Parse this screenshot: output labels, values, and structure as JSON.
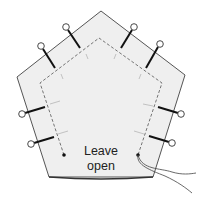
{
  "diagram": {
    "label": {
      "line1": "Leave",
      "line2": "open"
    },
    "colors": {
      "fabric_fill": "#efefef",
      "outline": "#555555",
      "stitch": "#666666",
      "pin_shaft": "#111111",
      "pin_head_fill": "#ffffff",
      "thread": "#444444"
    },
    "shapes": {
      "outer_pentagon": "101,11 185,75 153,177 49,177 17,77",
      "stitch_line": "64,155 40,83 99,38 162,83 138,155",
      "start_dot": [
        64,
        155
      ],
      "end_dot": [
        138,
        155
      ]
    },
    "pins": [
      {
        "name": "pin-top-left-1",
        "x1": 55,
        "y1": 68,
        "x2": 41,
        "y2": 46
      },
      {
        "name": "pin-top-left-2",
        "x1": 80,
        "y1": 48,
        "x2": 66,
        "y2": 27
      },
      {
        "name": "pin-top-right-1",
        "x1": 121,
        "y1": 48,
        "x2": 134,
        "y2": 27
      },
      {
        "name": "pin-top-right-2",
        "x1": 146,
        "y1": 68,
        "x2": 160,
        "y2": 44
      },
      {
        "name": "pin-left-1",
        "x1": 45,
        "y1": 107,
        "x2": 22,
        "y2": 114
      },
      {
        "name": "pin-left-2",
        "x1": 54,
        "y1": 137,
        "x2": 31,
        "y2": 144
      },
      {
        "name": "pin-right-1",
        "x1": 158,
        "y1": 107,
        "x2": 181,
        "y2": 114
      },
      {
        "name": "pin-right-2",
        "x1": 149,
        "y1": 136,
        "x2": 172,
        "y2": 143
      }
    ]
  }
}
